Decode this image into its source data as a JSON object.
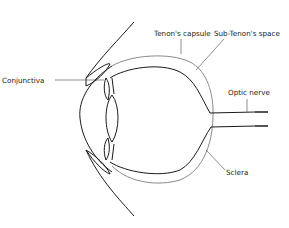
{
  "diagram": {
    "labels": {
      "conjunctiva": "Conjunctiva",
      "tenons_capsule": "Tenon's capsule",
      "sub_tenons_space": "Sub-Tenon's space",
      "optic_nerve": "Optic nerve",
      "sclera": "Sclera"
    },
    "colors": {
      "outline": "#1a1a1a",
      "capsule": "#8a8a8a",
      "text": "#222222"
    }
  }
}
